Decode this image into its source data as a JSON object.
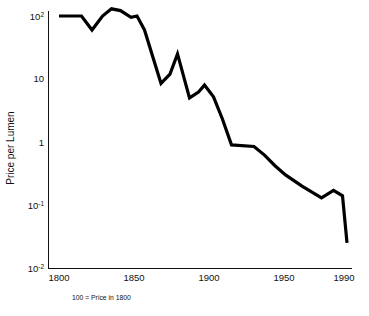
{
  "figure": {
    "background_color": "#ffffff",
    "width": 369,
    "height": 316
  },
  "caption": "100 = Price in 1800",
  "axis": {
    "y_title": "Price per Lumen",
    "y_tick_labels": [
      {
        "mantissa": "10",
        "exponent": "2",
        "value": 100
      },
      {
        "mantissa": "10",
        "exponent": "",
        "value": 10
      },
      {
        "mantissa": "1",
        "exponent": "",
        "value": 1
      },
      {
        "mantissa": "10",
        "exponent": "-1",
        "value": 0.1
      },
      {
        "mantissa": "10",
        "exponent": "-2",
        "value": 0.01
      }
    ],
    "x_tick_labels": [
      "1800",
      "1850",
      "1900",
      "1950",
      "1990"
    ],
    "line_color": "#111111"
  },
  "chart_data": {
    "type": "line",
    "title": "",
    "subtitle": "",
    "xlabel": "",
    "ylabel": "Price per Lumen",
    "annotation": "100 = Price in 1800",
    "xscale": "linear",
    "yscale": "log",
    "xlim": [
      1793,
      1996
    ],
    "ylim": [
      0.01,
      100
    ],
    "xticks": [
      1800,
      1850,
      1900,
      1950,
      1990
    ],
    "yticks": [
      0.01,
      0.1,
      1,
      10,
      100
    ],
    "ytick_labels": [
      "10^-2",
      "10^-1",
      "1",
      "10",
      "10^2"
    ],
    "grid": false,
    "legend": false,
    "legend_position": "none",
    "line_color": "#000000",
    "line_width": 3.2,
    "series": [
      {
        "name": "Price per Lumen",
        "x": [
          1800,
          1815,
          1822,
          1829,
          1835,
          1841,
          1848,
          1852,
          1857,
          1868,
          1874,
          1879,
          1887,
          1893,
          1897,
          1903,
          1909,
          1915,
          1930,
          1937,
          1944,
          1951,
          1962,
          1975,
          1983,
          1989,
          1992
        ],
        "y": [
          100,
          100,
          60,
          100,
          130,
          122,
          95,
          100,
          60,
          8.5,
          12,
          25,
          5.0,
          6.2,
          8.0,
          5.2,
          2.3,
          0.9,
          0.85,
          0.62,
          0.42,
          0.3,
          0.2,
          0.13,
          0.17,
          0.14,
          0.025
        ]
      }
    ]
  }
}
